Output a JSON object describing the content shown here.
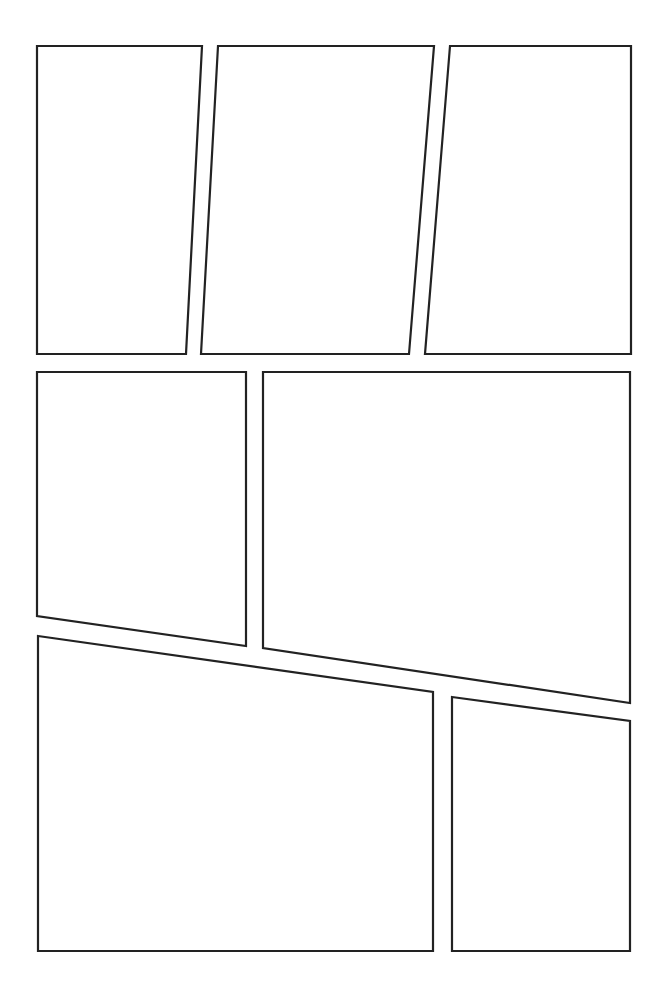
{
  "page": {
    "width": 664,
    "height": 986,
    "background": "#ffffff",
    "border_color": "#222222",
    "rows": 3,
    "panel_count": 7
  },
  "panels": [
    {
      "id": "panel-1",
      "row": 1,
      "points": "37,46 202,46 186,354 37,354"
    },
    {
      "id": "panel-2",
      "row": 1,
      "points": "218,46 434,46 409,354 201,354"
    },
    {
      "id": "panel-3",
      "row": 1,
      "points": "450,46 631,46 631,354 425,354"
    },
    {
      "id": "panel-4",
      "row": 2,
      "points": "37,372 246,372 246,646 37,616"
    },
    {
      "id": "panel-5",
      "row": 2,
      "points": "263,372 630,372 630,703 263,648"
    },
    {
      "id": "panel-6",
      "row": 3,
      "points": "38,636 433,692 433,951 38,951"
    },
    {
      "id": "panel-7",
      "row": 3,
      "points": "452,697 630,721 630,951 452,951"
    }
  ]
}
